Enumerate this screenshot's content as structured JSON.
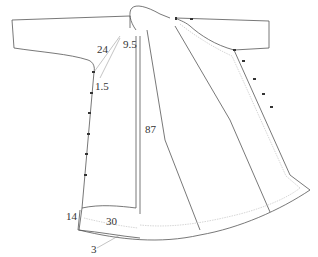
{
  "diagram": {
    "type": "garment-pattern",
    "colors": {
      "outline": "#555555",
      "seam_allowance": "#cccccc",
      "button": "#333333",
      "dimension_text": "#333333"
    },
    "dimensions": [
      {
        "id": "neck-width",
        "value": "9.5"
      },
      {
        "id": "slit-length",
        "value": "24"
      },
      {
        "id": "slit-offset",
        "value": "1.5"
      },
      {
        "id": "front-length",
        "value": "87"
      },
      {
        "id": "pocket-height",
        "value": "14"
      },
      {
        "id": "pocket-width",
        "value": "30"
      },
      {
        "id": "hem-allowance",
        "value": "3"
      }
    ],
    "buttons": {
      "left_placket_count": 6,
      "right_placket_count": 5,
      "collar_count": 2
    }
  }
}
